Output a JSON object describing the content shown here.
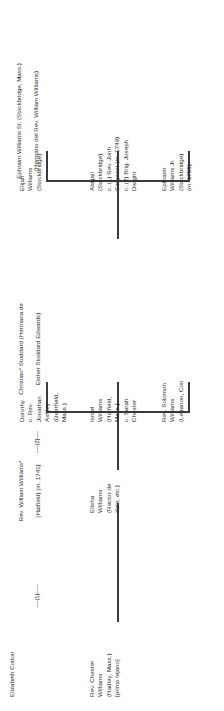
{
  "diagram": {
    "type": "family-tree",
    "title_note": "Genealogia Williams",
    "line_color": "#3a3a3a",
    "families": [
      {
        "id": "ephraim-sr",
        "parents": [
          "Ephraim Williams Sr. (Stockbridge, Mass.)",
          "(Hermano del Rev. William Williams)"
        ],
        "connector": "",
        "children": [
          "Ephraim\nWilliams Jr.\n(Stockbridge)\n(m. 1755)",
          "Abigail\n(Stockbridge)\nc. (1) Rev. Jonh\nSergeant (m. 1749)\nc. (2) Brig. Joseph\nDwight",
          "Elijah\nWilliams\n(Stockbridge)"
        ]
      },
      {
        "id": "william-williams-2",
        "parents": [
          "Christian* Stoddard (Hermana de",
          "Esther Stoddard Edwards)"
        ],
        "connector": "----(2)----",
        "children": [
          "Rev. Solomon\nWilliams\n(Lebanon, Con",
          "Israel\nWilliams\n(Hatfield,\nMass.)\nc. Sarah\nChester",
          "Dorothy\nc. Rev.\nJonathan\nAshley\n(Deerfield,\nMass.)"
        ]
      },
      {
        "id": "william-williams-1",
        "parents": [
          "Rev. William Williams* ",
          "(Hatfield) (m. 1741)"
        ],
        "connector": "----(1)-----",
        "spouse": "Elizabeth Cotton",
        "children": [
          "Elisha\nWilliams\n(Rector de\nYale, etc.)"
        ]
      }
    ],
    "standalone": [
      "Rev. Chester\nWilliams\n(Hadley, Mass.)\n[primo lejano]"
    ]
  }
}
